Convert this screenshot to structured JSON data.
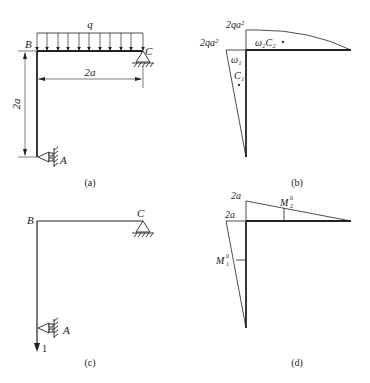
{
  "panels": {
    "a": {
      "caption": "(a)",
      "load_label": "q",
      "node_B": "B",
      "node_C": "C",
      "node_A": "A",
      "dim_horizontal": "2a",
      "dim_vertical": "2a"
    },
    "b": {
      "caption": "(b)",
      "moment_top": "2qa²",
      "moment_left": "2qa²",
      "area2_label": "ω₂C₂",
      "area1_label": "ω₁",
      "centroid1_label": "C₁"
    },
    "c": {
      "caption": "(c)",
      "node_B": "B",
      "node_C": "C",
      "node_A": "A",
      "unit_load": "1"
    },
    "d": {
      "caption": "(d)",
      "value_top": "2a",
      "value_left": "2a",
      "M2_label": "M",
      "M2_sup": "0",
      "M2_sub": "2",
      "M1_label": "M",
      "M1_sup": "0",
      "M1_sub": "1"
    }
  }
}
